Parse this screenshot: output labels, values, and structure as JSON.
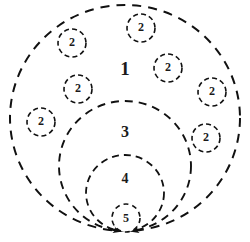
{
  "figure": {
    "type": "nested-dashed-circles-diagram",
    "background_color": "#ffffff",
    "stroke_color": "#111111",
    "label_color": "#1a1a1a",
    "width": 250,
    "height": 242,
    "convergence_point": {
      "x": 126,
      "y": 231
    },
    "regions": [
      {
        "id": "region-1",
        "label": "1",
        "label_x": 125,
        "label_y": 71,
        "font_size": 19,
        "cx": 125,
        "cy": 118,
        "rx": 115,
        "ry": 113,
        "dash": "9 7",
        "stroke_width": 2.0
      },
      {
        "id": "region-3",
        "label": "3",
        "label_x": 125,
        "label_y": 133,
        "font_size": 16,
        "cx": 125,
        "cy": 166,
        "rx": 66,
        "ry": 65,
        "dash": "8 6",
        "stroke_width": 1.9
      },
      {
        "id": "region-4",
        "label": "4",
        "label_x": 125,
        "label_y": 180,
        "font_size": 14,
        "cx": 125,
        "cy": 193,
        "rx": 39,
        "ry": 38,
        "dash": "7 5",
        "stroke_width": 1.8
      },
      {
        "id": "region-5",
        "label": "5",
        "label_x": 126,
        "label_y": 219,
        "font_size": 13,
        "cx": 126,
        "cy": 218,
        "rx": 14,
        "ry": 14,
        "dash": "5 4",
        "stroke_width": 1.7
      }
    ],
    "nodes": [
      {
        "id": "node-2-a",
        "label": "2",
        "cx": 72,
        "cy": 43,
        "r": 14
      },
      {
        "id": "node-2-b",
        "label": "2",
        "cx": 141,
        "cy": 28,
        "r": 14
      },
      {
        "id": "node-2-c",
        "label": "2",
        "cx": 168,
        "cy": 68,
        "r": 14
      },
      {
        "id": "node-2-d",
        "label": "2",
        "cx": 78,
        "cy": 89,
        "r": 14
      },
      {
        "id": "node-2-e",
        "label": "2",
        "cx": 212,
        "cy": 92,
        "r": 14
      },
      {
        "id": "node-2-f",
        "label": "2",
        "cx": 41,
        "cy": 122,
        "r": 14
      },
      {
        "id": "node-2-g",
        "label": "2",
        "cx": 206,
        "cy": 138,
        "r": 14
      }
    ],
    "arrows": [
      {
        "id": "arrow-left-outer",
        "x": 126,
        "y": 231,
        "angle": 22
      },
      {
        "id": "arrow-left-mid",
        "x": 126,
        "y": 231,
        "angle": 10
      },
      {
        "id": "arrow-right-outer",
        "x": 126,
        "y": 231,
        "angle": 158
      },
      {
        "id": "arrow-right-mid",
        "x": 126,
        "y": 231,
        "angle": 170
      }
    ]
  }
}
